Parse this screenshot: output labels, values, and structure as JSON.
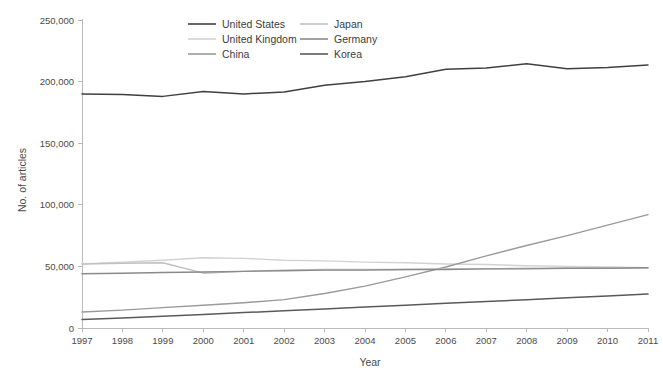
{
  "chart_data": {
    "type": "line",
    "title": "",
    "xlabel": "Year",
    "ylabel": "No. of articles",
    "x": [
      1997,
      1998,
      1999,
      2000,
      2001,
      2002,
      2003,
      2004,
      2005,
      2006,
      2007,
      2008,
      2009,
      2010,
      2011
    ],
    "xtick_labels": [
      "1997",
      "1998",
      "1999",
      "2000",
      "2001",
      "2002",
      "2003",
      "2004",
      "2005",
      "2006",
      "2007",
      "2008",
      "2009",
      "2010",
      "2011"
    ],
    "ytick_labels": [
      "0",
      "50,000",
      "100,000",
      "150,000",
      "200,000",
      "250,000"
    ],
    "yticks": [
      0,
      50000,
      100000,
      150000,
      200000,
      250000
    ],
    "xlim": [
      1997,
      2011
    ],
    "ylim": [
      0,
      250000
    ],
    "grid": false,
    "legend_position": "top-center",
    "series": [
      {
        "name": "United States",
        "color": "#404040",
        "width": 1.5,
        "values": [
          190000,
          189500,
          188000,
          192000,
          190000,
          191500,
          197000,
          200000,
          204000,
          210000,
          211000,
          214500,
          210500,
          211500,
          213500
        ]
      },
      {
        "name": "United Kingdom",
        "color": "#d2d2d2",
        "width": 1.4,
        "values": [
          52000,
          53500,
          55000,
          57000,
          56500,
          55000,
          54500,
          53500,
          53000,
          52000,
          51500,
          50500,
          50000,
          49500,
          49000
        ]
      },
      {
        "name": "China",
        "color": "#9a9a9a",
        "width": 1.4,
        "values": [
          13000,
          14500,
          16500,
          18500,
          20500,
          23000,
          28000,
          34000,
          41500,
          49500,
          58500,
          67000,
          75000,
          83500,
          92000
        ]
      },
      {
        "name": "Japan",
        "color": "#c0c0c0",
        "width": 1.4,
        "values": [
          52000,
          52500,
          53000,
          44500,
          46000,
          47000,
          47500,
          47500,
          47500,
          48000,
          48000,
          48500,
          48500,
          48500,
          48500
        ]
      },
      {
        "name": "Germany",
        "color": "#8a8a8a",
        "width": 1.4,
        "values": [
          44000,
          44500,
          45000,
          45500,
          46000,
          46500,
          47000,
          47000,
          47500,
          47500,
          48000,
          48000,
          48500,
          48500,
          49000
        ]
      },
      {
        "name": "Korea",
        "color": "#5a5a5a",
        "width": 1.5,
        "values": [
          7000,
          8200,
          9500,
          11000,
          12500,
          14000,
          15500,
          17000,
          18500,
          20000,
          21500,
          23000,
          24500,
          26000,
          27500
        ]
      }
    ]
  },
  "axes": {
    "y_title": "No. of articles",
    "x_title": "Year"
  },
  "legend": {
    "items": [
      {
        "label": "United States",
        "color": "#404040"
      },
      {
        "label": "Japan",
        "color": "#c0c0c0"
      },
      {
        "label": "United Kingdom",
        "color": "#d2d2d2"
      },
      {
        "label": "Germany",
        "color": "#8a8a8a"
      },
      {
        "label": "China",
        "color": "#9a9a9a"
      },
      {
        "label": "Korea",
        "color": "#5a5a5a"
      }
    ]
  }
}
